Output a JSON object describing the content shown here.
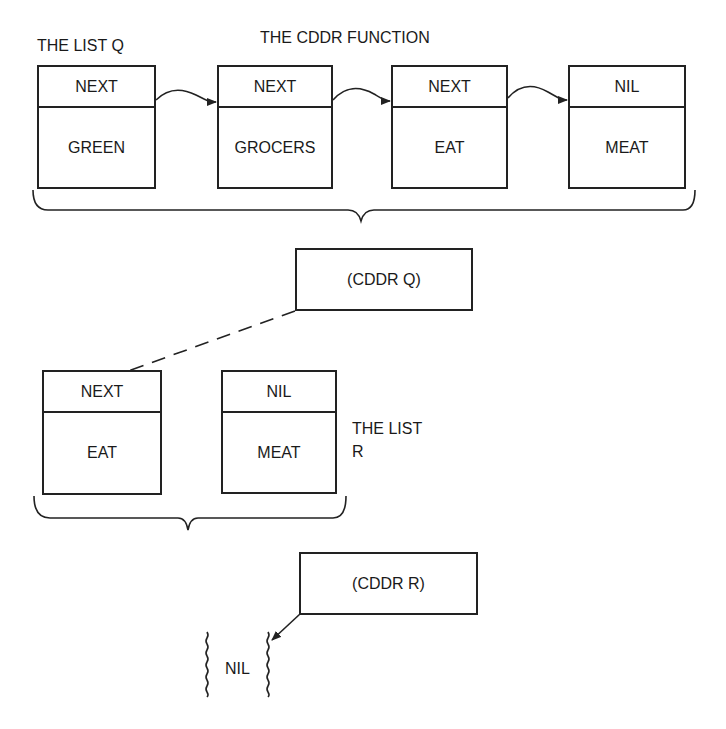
{
  "labels": {
    "list_q": "THE LIST Q",
    "function_title": "THE CDDR FUNCTION",
    "list_r_line1": "THE LIST",
    "list_r_line2": "R",
    "nil_result": "NIL"
  },
  "list_q": {
    "cells": [
      {
        "pointer": "NEXT",
        "value": "GREEN"
      },
      {
        "pointer": "NEXT",
        "value": "GROCERS"
      },
      {
        "pointer": "NEXT",
        "value": "EAT"
      },
      {
        "pointer": "NIL",
        "value": "MEAT"
      }
    ]
  },
  "operations": {
    "cddr_q": "(CDDR Q)",
    "cddr_r": "(CDDR R)"
  },
  "list_r": {
    "cells": [
      {
        "pointer": "NEXT",
        "value": "EAT"
      },
      {
        "pointer": "NIL",
        "value": "MEAT"
      }
    ]
  },
  "colors": {
    "line": "#222222",
    "background": "#ffffff"
  }
}
